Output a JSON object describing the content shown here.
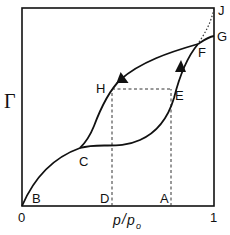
{
  "diagram": {
    "type": "adsorption-isotherm-hysteresis",
    "y_axis_label": "Γ",
    "x_axis_label": {
      "p": "p",
      "sep": "/",
      "p0": "p",
      "p0_subscript": "o"
    },
    "x_ticks": [
      "0",
      "1"
    ],
    "points": {
      "B": "B",
      "C": "C",
      "D": "D",
      "A": "A",
      "E": "E",
      "F": "F",
      "G": "G",
      "H": "H",
      "J": "J"
    },
    "curves": [
      {
        "name": "adsorption-branch",
        "path": "B-C-E-F",
        "direction": "up"
      },
      {
        "name": "desorption-branch",
        "path": "F-H-C",
        "direction": "down"
      },
      {
        "name": "upper-branch",
        "path": "F-G"
      },
      {
        "name": "condensation-dotted",
        "path": "F-J",
        "style": "dotted"
      }
    ],
    "guides": [
      {
        "name": "D-to-H",
        "style": "dashed"
      },
      {
        "name": "A-to-E",
        "style": "dashed"
      },
      {
        "name": "H-to-E",
        "style": "dashed"
      }
    ],
    "colors": {
      "ink": "#111111",
      "background": "#ffffff"
    }
  }
}
